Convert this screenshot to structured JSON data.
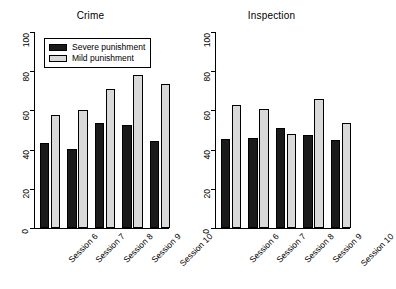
{
  "chart_data": [
    {
      "type": "bar",
      "title": "Crime",
      "xlabel": "",
      "ylabel": "",
      "ylim": [
        0,
        100
      ],
      "yticks": [
        0,
        20,
        40,
        60,
        80,
        100
      ],
      "grid": false,
      "legend_position": "top-left",
      "categories": [
        "Session 6",
        "Session 7",
        "Session 8",
        "Session 9",
        "Session 10"
      ],
      "series": [
        {
          "name": "Severe punishment",
          "color": "#1a1a1a",
          "values": [
            43.5,
            40.5,
            53.5,
            52.5,
            44.5
          ]
        },
        {
          "name": "Mild punishment",
          "color": "#d9d9d9",
          "values": [
            57.5,
            60.0,
            71.0,
            78.0,
            73.5
          ]
        }
      ]
    },
    {
      "type": "bar",
      "title": "Inspection",
      "xlabel": "",
      "ylabel": "",
      "ylim": [
        0,
        100
      ],
      "yticks": [
        0,
        20,
        40,
        60,
        80,
        100
      ],
      "grid": false,
      "legend_position": "none",
      "categories": [
        "Session 6",
        "Session 7",
        "Session 8",
        "Session 9",
        "Session 10"
      ],
      "series": [
        {
          "name": "Severe punishment",
          "color": "#1a1a1a",
          "values": [
            45.5,
            46.0,
            51.0,
            47.5,
            45.0
          ]
        },
        {
          "name": "Mild punishment",
          "color": "#d9d9d9",
          "values": [
            63.0,
            60.5,
            48.0,
            66.0,
            53.5
          ]
        }
      ]
    }
  ],
  "panels": {
    "crime": {
      "title": "Crime",
      "yticks": [
        "100",
        "80",
        "60",
        "40",
        "20",
        "0"
      ],
      "xticks": [
        "Session 6",
        "Session 7",
        "Session 8",
        "Session 9",
        "Session 10"
      ]
    },
    "inspection": {
      "title": "Inspection",
      "yticks": [
        "100",
        "80",
        "60",
        "40",
        "20",
        "0"
      ],
      "xticks": [
        "Session 6",
        "Session 7",
        "Session 8",
        "Session 9",
        "Session 10"
      ]
    }
  },
  "legend": {
    "entries": [
      {
        "label": "Severe punishment",
        "swatch": "#1a1a1a"
      },
      {
        "label": "Mild punishment",
        "swatch": "#d9d9d9"
      }
    ]
  }
}
